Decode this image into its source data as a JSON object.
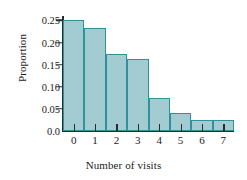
{
  "chart_data": {
    "type": "bar",
    "title": "",
    "xlabel": "Number of visits",
    "ylabel": "Proportion",
    "categories": [
      "0",
      "1",
      "2",
      "3",
      "4",
      "5",
      "6",
      "7"
    ],
    "values": [
      0.25,
      0.233,
      0.175,
      0.162,
      0.075,
      0.04,
      0.025,
      0.025
    ],
    "ylim": [
      0.0,
      0.26
    ],
    "yticks": [
      0.0,
      0.05,
      0.1,
      0.15,
      0.2,
      0.25
    ],
    "ytick_labels": [
      "0.0",
      "0.05",
      "0.10",
      "0.15",
      "0.20",
      "0.25"
    ],
    "grid": false,
    "legend": null,
    "bar_fill_color": "#a3ccd2",
    "bar_edge_color": "#2f9199",
    "axis_color": "#2b2b2b",
    "background_color": "#ffffff"
  }
}
